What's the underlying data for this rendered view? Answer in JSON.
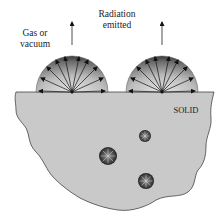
{
  "diagram": {
    "labels": {
      "medium_line1": "Gas or",
      "medium_line2": "vacuum",
      "radiation_line1": "Radiation",
      "radiation_line2": "emitted",
      "solid": "SOLID"
    },
    "colors": {
      "solid_fill": "#c9c9c9",
      "outline": "#444444",
      "hemisphere_dark": "#3a3a3a",
      "hemisphere_light": "#d8d8d8",
      "arrow": "#111111"
    },
    "surface_emitters": [
      {
        "name": "left-hemisphere",
        "cx": 72,
        "cy": 92,
        "r": 36
      },
      {
        "name": "right-hemisphere",
        "cx": 162,
        "cy": 92,
        "r": 36
      }
    ],
    "internal_emitters": [
      {
        "name": "small-sphere",
        "cx": 145,
        "cy": 136,
        "r": 6
      },
      {
        "name": "large-sphere",
        "cx": 108,
        "cy": 156,
        "r": 9
      },
      {
        "name": "medium-sphere",
        "cx": 146,
        "cy": 181,
        "r": 8
      }
    ]
  }
}
